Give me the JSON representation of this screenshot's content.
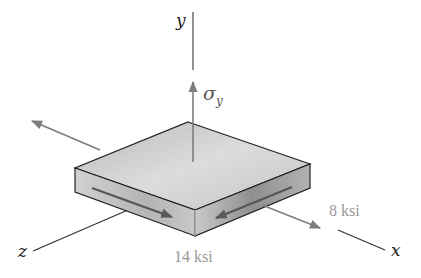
{
  "diagram": {
    "type": "stress-element-3d",
    "axes": {
      "x": "x",
      "y": "y",
      "z": "z"
    },
    "normal_stress": {
      "symbol": "σ",
      "subscript": "y"
    },
    "shear_stresses": [
      {
        "value": "14 ksi",
        "face": "front-left (z face)"
      },
      {
        "value": "8 ksi",
        "face": "front-right (x face)"
      }
    ],
    "colors": {
      "axis_line": "#333333",
      "arrow": "#808080",
      "label_gray": "#9a9a9a",
      "block_top": "#cfcfcf",
      "block_left": "#bdbdbd",
      "block_right": "#a9a9a9",
      "edge": "#222222"
    }
  }
}
